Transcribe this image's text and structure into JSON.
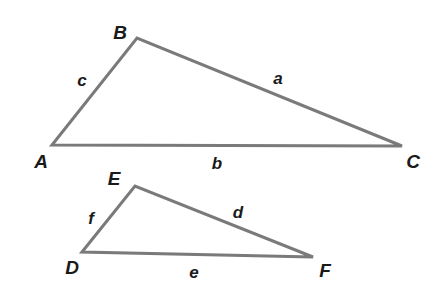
{
  "figure": {
    "background_color": "#ffffff",
    "stroke_color": "#7a7a7a",
    "label_color": "#1a1a1a",
    "stroke_width": 3,
    "width": 437,
    "height": 308
  },
  "triangles": [
    {
      "name": "triangle-abc",
      "vertices": [
        {
          "id": "A",
          "label": "A",
          "x": 52,
          "y": 145,
          "label_x": 41,
          "label_y": 161
        },
        {
          "id": "B",
          "label": "B",
          "x": 137,
          "y": 38,
          "label_x": 120,
          "label_y": 32
        },
        {
          "id": "C",
          "label": "C",
          "x": 402,
          "y": 146,
          "label_x": 413,
          "label_y": 161
        }
      ],
      "sides": [
        {
          "id": "a",
          "label": "a",
          "from": "B",
          "to": "C",
          "label_x": 278,
          "label_y": 78
        },
        {
          "id": "b",
          "label": "b",
          "from": "A",
          "to": "C",
          "label_x": 217,
          "label_y": 163
        },
        {
          "id": "c",
          "label": "c",
          "from": "A",
          "to": "B",
          "label_x": 82,
          "label_y": 80
        }
      ]
    },
    {
      "name": "triangle-def",
      "vertices": [
        {
          "id": "D",
          "label": "D",
          "x": 82,
          "y": 252,
          "label_x": 72,
          "label_y": 267
        },
        {
          "id": "E",
          "label": "E",
          "x": 135,
          "y": 186,
          "label_x": 114,
          "label_y": 178
        },
        {
          "id": "F",
          "label": "F",
          "x": 313,
          "y": 257,
          "label_x": 325,
          "label_y": 270
        }
      ],
      "sides": [
        {
          "id": "d",
          "label": "d",
          "from": "E",
          "to": "F",
          "label_x": 238,
          "label_y": 212
        },
        {
          "id": "e",
          "label": "e",
          "from": "D",
          "to": "F",
          "label_x": 194,
          "label_y": 272
        },
        {
          "id": "f",
          "label": "f",
          "from": "D",
          "to": "E",
          "label_x": 91,
          "label_y": 218
        }
      ]
    }
  ]
}
